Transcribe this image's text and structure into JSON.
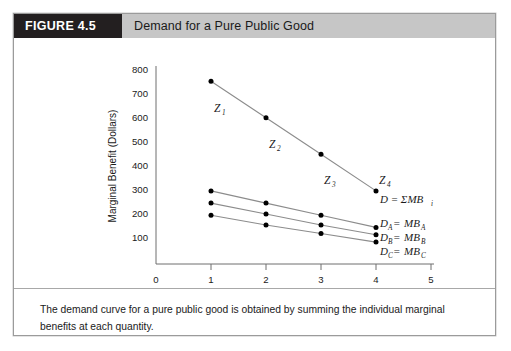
{
  "figure": {
    "number_label": "FIGURE 4.5",
    "title": "Demand for a Pure Public Good",
    "caption": "The demand curve for a pure public good is obtained by summing the individual marginal benefits at each quantity."
  },
  "colors": {
    "header_number_bg": "#231f20",
    "header_number_text": "#ffffff",
    "header_title_bg": "#c6c6c6",
    "header_title_text": "#1a1a1a",
    "border": "#9b9b9b",
    "axis": "#6e6e6e",
    "curve": "#8c8c8c",
    "point": "#000000",
    "page_bg": "#ffffff"
  },
  "chart_data": {
    "type": "line",
    "title": "Demand for a Pure Public Good",
    "xlabel": "Security Guards per Week",
    "ylabel": "Marginal Benefit (Dollars)",
    "xlim": [
      0,
      5
    ],
    "ylim": [
      0,
      800
    ],
    "xticks": [
      "0",
      "1",
      "2",
      "3",
      "4",
      "5"
    ],
    "yticks": [
      "100",
      "200",
      "300",
      "400",
      "500",
      "600",
      "700",
      "800"
    ],
    "grid": false,
    "legend": "inline-right",
    "x": [
      1,
      2,
      3,
      4
    ],
    "series": [
      {
        "name": "D = ΣMB",
        "name_base": "D = ΣMB",
        "name_sub": "i",
        "values": [
          750,
          600,
          450,
          300
        ],
        "point_labels": [
          {
            "base": "Z",
            "sub": "1"
          },
          {
            "base": "Z",
            "sub": "2"
          },
          {
            "base": "Z",
            "sub": "3"
          },
          {
            "base": "Z",
            "sub": "4"
          }
        ]
      },
      {
        "name": "D_A = MB_A",
        "label_parts": {
          "d": "D",
          "d_sub": "A",
          "eq": " = ",
          "mb": "MB",
          "mb_sub": "A"
        },
        "values": [
          300,
          250,
          200,
          150
        ]
      },
      {
        "name": "D_B = MB_B",
        "label_parts": {
          "d": "D",
          "d_sub": "B",
          "eq": " = ",
          "mb": "MB",
          "mb_sub": "B"
        },
        "values": [
          250,
          205,
          160,
          120
        ]
      },
      {
        "name": "D_C = MB_C",
        "label_parts": {
          "d": "D",
          "d_sub": "C",
          "eq": " = ",
          "mb": "MB",
          "mb_sub": "C"
        },
        "values": [
          200,
          160,
          125,
          90
        ]
      }
    ]
  }
}
